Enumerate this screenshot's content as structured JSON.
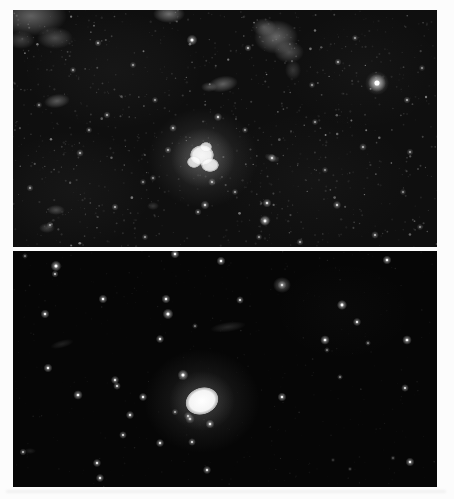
{
  "page": {
    "width": 454,
    "height": 499,
    "background": "#fcfcfc"
  },
  "artifacts": {
    "bottom_smudge": {
      "x": 6,
      "y": 490,
      "width": 440,
      "height": 3,
      "color": "#e6e6e6"
    }
  },
  "panels": [
    {
      "id": "top-photograph",
      "left": 13,
      "top": 10,
      "width": 424,
      "height": 237,
      "bg": "#0f0f0f",
      "noise": {
        "seed": 7,
        "color": "235,235,235",
        "layers": [
          {
            "count": 700,
            "min_r": 0.4,
            "max_r": 1.2,
            "min_a": 0.04,
            "max_a": 0.13
          },
          {
            "count": 300,
            "min_r": 0.4,
            "max_r": 1.1,
            "min_a": 0.12,
            "max_a": 0.3
          },
          {
            "count": 60,
            "min_r": 0.6,
            "max_r": 1.4,
            "min_a": 0.3,
            "max_a": 0.5
          }
        ]
      },
      "glows": [
        {
          "x": 100,
          "y": 60,
          "rx": 90,
          "ry": 60,
          "a": 0.04
        },
        {
          "x": 300,
          "y": 170,
          "rx": 100,
          "ry": 70,
          "a": 0.03
        },
        {
          "x": 60,
          "y": 180,
          "rx": 80,
          "ry": 60,
          "a": 0.04
        },
        {
          "x": 350,
          "y": 60,
          "rx": 80,
          "ry": 60,
          "a": 0.03
        },
        {
          "x": 18,
          "y": 6,
          "rx": 36,
          "ry": 20,
          "a": 0.42
        },
        {
          "x": 42,
          "y": 28,
          "rx": 18,
          "ry": 11,
          "a": 0.3
        },
        {
          "x": 8,
          "y": 30,
          "rx": 14,
          "ry": 9,
          "a": 0.25
        },
        {
          "x": 156,
          "y": 4,
          "rx": 16,
          "ry": 9,
          "a": 0.5
        },
        {
          "x": 263,
          "y": 27,
          "rx": 22,
          "ry": 17,
          "a": 0.45
        },
        {
          "x": 276,
          "y": 42,
          "rx": 15,
          "ry": 11,
          "a": 0.32
        },
        {
          "x": 251,
          "y": 17,
          "rx": 12,
          "ry": 9,
          "a": 0.3
        },
        {
          "x": 280,
          "y": 60,
          "rx": 8,
          "ry": 10,
          "a": 0.2
        },
        {
          "x": 210,
          "y": 74,
          "rx": 15,
          "ry": 8,
          "a": 0.42,
          "rot": -10
        },
        {
          "x": 196,
          "y": 77,
          "rx": 8,
          "ry": 5,
          "a": 0.3
        },
        {
          "x": 44,
          "y": 91,
          "rx": 13,
          "ry": 7,
          "a": 0.38,
          "rot": -8
        },
        {
          "x": 43,
          "y": 200,
          "rx": 9,
          "ry": 5,
          "a": 0.3
        },
        {
          "x": 34,
          "y": 218,
          "rx": 8,
          "ry": 5,
          "a": 0.25
        },
        {
          "x": 140,
          "y": 196,
          "rx": 6,
          "ry": 4,
          "a": 0.2
        },
        {
          "x": 190,
          "y": 148,
          "rx": 55,
          "ry": 50,
          "a": 0.16
        },
        {
          "x": 190,
          "y": 148,
          "rx": 32,
          "ry": 30,
          "a": 0.28
        },
        {
          "x": 364,
          "y": 73,
          "rx": 12,
          "ry": 12,
          "a": 0.35
        },
        {
          "x": 259,
          "y": 148,
          "rx": 8,
          "ry": 4,
          "a": 0.3,
          "rot": 20
        },
        {
          "x": 252,
          "y": 210,
          "rx": 6,
          "ry": 5,
          "a": 0.3
        }
      ],
      "stars": [
        {
          "x": 364,
          "y": 73,
          "r": 3.0,
          "b": 1.0
        },
        {
          "x": 179,
          "y": 30,
          "r": 1.8,
          "b": 0.85
        },
        {
          "x": 235,
          "y": 38,
          "r": 1.2,
          "b": 0.55
        },
        {
          "x": 205,
          "y": 107,
          "r": 1.4,
          "b": 0.6
        },
        {
          "x": 160,
          "y": 118,
          "r": 1.3,
          "b": 0.55
        },
        {
          "x": 259,
          "y": 148,
          "r": 1.4,
          "b": 0.6
        },
        {
          "x": 254,
          "y": 193,
          "r": 1.5,
          "b": 0.7
        },
        {
          "x": 252,
          "y": 211,
          "r": 1.7,
          "b": 0.8
        },
        {
          "x": 394,
          "y": 90,
          "r": 1.2,
          "b": 0.5
        },
        {
          "x": 325,
          "y": 52,
          "r": 1.2,
          "b": 0.5
        },
        {
          "x": 350,
          "y": 137,
          "r": 1.3,
          "b": 0.5
        },
        {
          "x": 324,
          "y": 195,
          "r": 1.4,
          "b": 0.6
        },
        {
          "x": 362,
          "y": 225,
          "r": 1.3,
          "b": 0.55
        },
        {
          "x": 287,
          "y": 232,
          "r": 1.2,
          "b": 0.5
        },
        {
          "x": 102,
          "y": 197,
          "r": 1.2,
          "b": 0.5
        },
        {
          "x": 67,
          "y": 143,
          "r": 1.3,
          "b": 0.5
        },
        {
          "x": 17,
          "y": 178,
          "r": 1.2,
          "b": 0.45
        },
        {
          "x": 94,
          "y": 105,
          "r": 1.2,
          "b": 0.5
        },
        {
          "x": 37,
          "y": 215,
          "r": 1.2,
          "b": 0.45
        },
        {
          "x": 192,
          "y": 195,
          "r": 1.5,
          "b": 0.65
        },
        {
          "x": 199,
          "y": 172,
          "r": 1.3,
          "b": 0.55
        },
        {
          "x": 130,
          "y": 172,
          "r": 1.1,
          "b": 0.4
        },
        {
          "x": 60,
          "y": 60,
          "r": 1.1,
          "b": 0.45
        },
        {
          "x": 85,
          "y": 33,
          "r": 1.2,
          "b": 0.5
        },
        {
          "x": 120,
          "y": 55,
          "r": 1.1,
          "b": 0.45
        },
        {
          "x": 142,
          "y": 90,
          "r": 1.1,
          "b": 0.45
        },
        {
          "x": 155,
          "y": 140,
          "r": 1.2,
          "b": 0.5
        },
        {
          "x": 232,
          "y": 120,
          "r": 1.1,
          "b": 0.45
        },
        {
          "x": 302,
          "y": 112,
          "r": 1.1,
          "b": 0.45
        },
        {
          "x": 342,
          "y": 28,
          "r": 1.1,
          "b": 0.45
        },
        {
          "x": 397,
          "y": 142,
          "r": 1.2,
          "b": 0.45
        },
        {
          "x": 409,
          "y": 58,
          "r": 1.1,
          "b": 0.4
        },
        {
          "x": 299,
          "y": 75,
          "r": 1.1,
          "b": 0.45
        },
        {
          "x": 185,
          "y": 202,
          "r": 1.2,
          "b": 0.5
        },
        {
          "x": 140,
          "y": 168,
          "r": 1.1,
          "b": 0.4
        },
        {
          "x": 222,
          "y": 182,
          "r": 1.1,
          "b": 0.45
        },
        {
          "x": 76,
          "y": 120,
          "r": 1.1,
          "b": 0.45
        },
        {
          "x": 26,
          "y": 95,
          "r": 1.1,
          "b": 0.4
        },
        {
          "x": 312,
          "y": 160,
          "r": 1.1,
          "b": 0.4
        },
        {
          "x": 390,
          "y": 182,
          "r": 1.1,
          "b": 0.4
        },
        {
          "x": 407,
          "y": 217,
          "r": 1.1,
          "b": 0.4
        },
        {
          "x": 246,
          "y": 227,
          "r": 1.1,
          "b": 0.45
        },
        {
          "x": 132,
          "y": 227,
          "r": 1.1,
          "b": 0.45
        }
      ],
      "cores": [
        {
          "x": 189,
          "y": 145,
          "rx": 12,
          "ry": 10,
          "a": 0.95
        },
        {
          "x": 197,
          "y": 155,
          "rx": 9,
          "ry": 7,
          "a": 0.88
        },
        {
          "x": 181,
          "y": 152,
          "rx": 7,
          "ry": 6,
          "a": 0.82
        },
        {
          "x": 193,
          "y": 137,
          "rx": 6,
          "ry": 5,
          "a": 0.78
        }
      ]
    },
    {
      "id": "bottom-photograph",
      "left": 13,
      "top": 251,
      "width": 424,
      "height": 236,
      "bg": "#060606",
      "noise": {
        "seed": 13,
        "color": "220,220,220",
        "layers": [
          {
            "count": 400,
            "min_r": 0.3,
            "max_r": 0.9,
            "min_a": 0.02,
            "max_a": 0.07
          },
          {
            "count": 80,
            "min_r": 0.4,
            "max_r": 0.9,
            "min_a": 0.06,
            "max_a": 0.14
          }
        ]
      },
      "glows": [
        {
          "x": 330,
          "y": 60,
          "rx": 70,
          "ry": 50,
          "a": 0.02
        },
        {
          "x": 189,
          "y": 150,
          "rx": 58,
          "ry": 52,
          "a": 0.13
        },
        {
          "x": 189,
          "y": 150,
          "rx": 33,
          "ry": 30,
          "a": 0.2
        },
        {
          "x": 269,
          "y": 34,
          "rx": 9,
          "ry": 8,
          "a": 0.4
        },
        {
          "x": 215,
          "y": 76,
          "rx": 18,
          "ry": 5,
          "a": 0.16,
          "rot": -8
        },
        {
          "x": 49,
          "y": 93,
          "rx": 12,
          "ry": 4,
          "a": 0.13,
          "rot": -15
        },
        {
          "x": 17,
          "y": 200,
          "rx": 6,
          "ry": 3,
          "a": 0.12
        }
      ],
      "stars": [
        {
          "x": 162,
          "y": 3,
          "r": 1.5,
          "b": 0.9
        },
        {
          "x": 208,
          "y": 10,
          "r": 1.5,
          "b": 0.85
        },
        {
          "x": 374,
          "y": 9,
          "r": 1.5,
          "b": 0.9
        },
        {
          "x": 12,
          "y": 5,
          "r": 1.0,
          "b": 0.4
        },
        {
          "x": 43,
          "y": 15,
          "r": 1.8,
          "b": 0.95
        },
        {
          "x": 42,
          "y": 23,
          "r": 1.2,
          "b": 0.6
        },
        {
          "x": 90,
          "y": 48,
          "r": 1.5,
          "b": 0.85
        },
        {
          "x": 153,
          "y": 48,
          "r": 1.5,
          "b": 0.85
        },
        {
          "x": 227,
          "y": 49,
          "r": 1.3,
          "b": 0.7
        },
        {
          "x": 329,
          "y": 54,
          "r": 1.7,
          "b": 0.95
        },
        {
          "x": 269,
          "y": 34,
          "r": 1.5,
          "b": 0.6
        },
        {
          "x": 32,
          "y": 63,
          "r": 1.5,
          "b": 0.8
        },
        {
          "x": 155,
          "y": 63,
          "r": 1.8,
          "b": 0.95
        },
        {
          "x": 344,
          "y": 71,
          "r": 1.4,
          "b": 0.75
        },
        {
          "x": 182,
          "y": 75,
          "r": 1.0,
          "b": 0.4
        },
        {
          "x": 147,
          "y": 88,
          "r": 1.4,
          "b": 0.75
        },
        {
          "x": 312,
          "y": 89,
          "r": 1.6,
          "b": 0.9
        },
        {
          "x": 394,
          "y": 89,
          "r": 1.6,
          "b": 0.9
        },
        {
          "x": 355,
          "y": 92,
          "r": 1.0,
          "b": 0.45
        },
        {
          "x": 314,
          "y": 99,
          "r": 1.0,
          "b": 0.4
        },
        {
          "x": 35,
          "y": 117,
          "r": 1.5,
          "b": 0.8
        },
        {
          "x": 170,
          "y": 124,
          "r": 1.8,
          "b": 0.95
        },
        {
          "x": 327,
          "y": 126,
          "r": 1.0,
          "b": 0.45
        },
        {
          "x": 102,
          "y": 129,
          "r": 1.4,
          "b": 0.75
        },
        {
          "x": 104,
          "y": 135,
          "r": 1.3,
          "b": 0.7
        },
        {
          "x": 65,
          "y": 144,
          "r": 1.6,
          "b": 0.85
        },
        {
          "x": 130,
          "y": 146,
          "r": 1.4,
          "b": 0.8
        },
        {
          "x": 269,
          "y": 146,
          "r": 1.5,
          "b": 0.8
        },
        {
          "x": 392,
          "y": 137,
          "r": 1.3,
          "b": 0.7
        },
        {
          "x": 162,
          "y": 161,
          "r": 1.1,
          "b": 0.5
        },
        {
          "x": 117,
          "y": 164,
          "r": 1.4,
          "b": 0.75
        },
        {
          "x": 177,
          "y": 168,
          "r": 1.6,
          "b": 0.55
        },
        {
          "x": 197,
          "y": 173,
          "r": 1.5,
          "b": 0.8
        },
        {
          "x": 175,
          "y": 165,
          "r": 1.4,
          "b": 0.5
        },
        {
          "x": 179,
          "y": 191,
          "r": 1.3,
          "b": 0.7
        },
        {
          "x": 110,
          "y": 184,
          "r": 1.3,
          "b": 0.7
        },
        {
          "x": 147,
          "y": 192,
          "r": 1.4,
          "b": 0.75
        },
        {
          "x": 10,
          "y": 201,
          "r": 1.2,
          "b": 0.55
        },
        {
          "x": 397,
          "y": 211,
          "r": 1.5,
          "b": 0.8
        },
        {
          "x": 380,
          "y": 207,
          "r": 0.9,
          "b": 0.3
        },
        {
          "x": 84,
          "y": 212,
          "r": 1.4,
          "b": 0.75
        },
        {
          "x": 194,
          "y": 219,
          "r": 1.4,
          "b": 0.75
        },
        {
          "x": 87,
          "y": 227,
          "r": 1.4,
          "b": 0.75
        },
        {
          "x": 337,
          "y": 218,
          "r": 0.8,
          "b": 0.25
        },
        {
          "x": 320,
          "y": 209,
          "r": 0.8,
          "b": 0.2
        }
      ],
      "cores": [
        {
          "x": 189,
          "y": 150,
          "rx": 17,
          "ry": 13.5,
          "rot": -20,
          "a": 1.0
        }
      ]
    }
  ]
}
